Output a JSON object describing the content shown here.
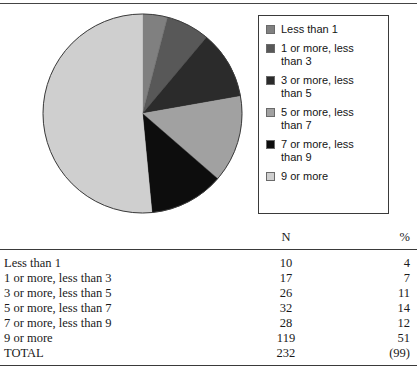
{
  "figure": {
    "legend": {
      "items": [
        {
          "label": "Less than 1",
          "color": "#808080",
          "swatch_name": "legend-swatch-less-than-1"
        },
        {
          "label": "1 or more, less than 3",
          "color": "#585858",
          "swatch_name": "legend-swatch-1-to-3"
        },
        {
          "label": "3 or more, less than 5",
          "color": "#2b2b2b",
          "swatch_name": "legend-swatch-3-to-5"
        },
        {
          "label": "5 or more, less than 7",
          "color": "#a1a1a1",
          "swatch_name": "legend-swatch-5-to-7"
        },
        {
          "label": "7 or more, less than 9",
          "color": "#0d0d0d",
          "swatch_name": "legend-swatch-7-to-9"
        },
        {
          "label": "9 or more",
          "color": "#cfcfcf",
          "swatch_name": "legend-swatch-9-or-more"
        }
      ]
    }
  },
  "chart_data": {
    "type": "pie",
    "title": "",
    "categories": [
      "Less than 1",
      "1 or more, less than 3",
      "3 or more, less than 5",
      "5 or more, less than 7",
      "7 or more, less than 9",
      "9 or more"
    ],
    "values": [
      4,
      7,
      11,
      14,
      12,
      51
    ],
    "counts": [
      10,
      17,
      26,
      32,
      28,
      119
    ],
    "colors": [
      "#808080",
      "#585858",
      "#2b2b2b",
      "#a1a1a1",
      "#0d0d0d",
      "#cfcfcf"
    ],
    "units": "percent",
    "start_angle": 0,
    "direction": "clockwise",
    "legend": "right",
    "grid": false,
    "total_n": 232,
    "total_pct": "(99)"
  },
  "table": {
    "columns": [
      "",
      "N",
      "%"
    ],
    "rows": [
      {
        "label": "Less than 1",
        "n": "10",
        "pct": "4"
      },
      {
        "label": "1 or more, less than 3",
        "n": "17",
        "pct": "7"
      },
      {
        "label": "3 or more, less than 5",
        "n": "26",
        "pct": "11"
      },
      {
        "label": "5 or more, less than 7",
        "n": "32",
        "pct": "14"
      },
      {
        "label": "7 or more, less than 9",
        "n": "28",
        "pct": "12"
      },
      {
        "label": "9 or more",
        "n": "119",
        "pct": "51"
      },
      {
        "label": "TOTAL",
        "n": "232",
        "pct": "(99)"
      }
    ]
  }
}
